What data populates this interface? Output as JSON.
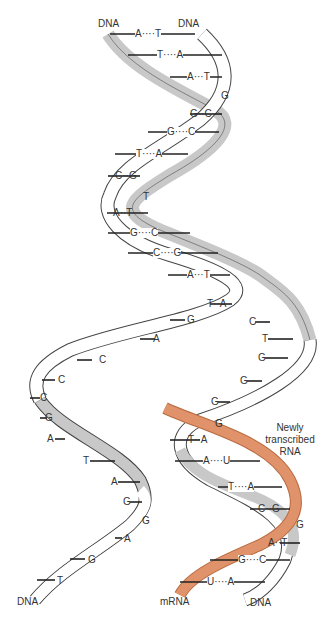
{
  "labels": {
    "dna_top_left": "DNA",
    "dna_top_right": "DNA",
    "dna_bottom_left": "DNA",
    "dna_bottom_right": "DNA",
    "mrna": "mRNA",
    "newly_transcribed_rna": [
      "Newly",
      "transcribed",
      "RNA"
    ]
  },
  "colors": {
    "ribbon_front": "#ffffff",
    "ribbon_back": "#c8c8c8",
    "ribbon_outline": "#444444",
    "rna_ribbon": "#e0936a",
    "text": "#333333"
  },
  "upper_helix_pairs": [
    "A····T",
    "T····A",
    "A···T",
    "G··C",
    "G····C",
    "T····A",
    "C··G",
    "A··T",
    "G····C",
    "C····G",
    "A···T",
    "T··A"
  ],
  "free_bases": {
    "after_pair_3": "G",
    "after_pair_7": "T",
    "coding_strand_left": [
      "G",
      "A",
      "C",
      "C",
      "C",
      "G",
      "A",
      "T",
      "A",
      "G",
      "G",
      "A",
      "G",
      "T"
    ],
    "template_strand_right": [
      "C",
      "T",
      "G",
      "G",
      "G",
      "G"
    ]
  },
  "transcription_pairs": [
    "T··A",
    "A····U",
    "T····A",
    "C··G",
    "A··T",
    "G····C",
    "U····A"
  ],
  "transcription_free_base": "G",
  "transcription_free_base_2": "G"
}
